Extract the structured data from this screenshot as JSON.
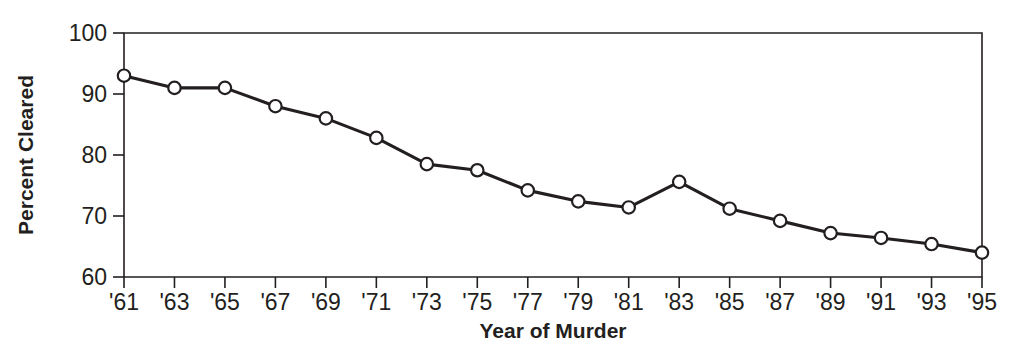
{
  "chart_data": {
    "type": "line",
    "title": "",
    "xlabel": "Year of Murder",
    "ylabel": "Percent Cleared",
    "categories": [
      "'61",
      "'63",
      "'65",
      "'67",
      "'69",
      "'71",
      "'73",
      "'75",
      "'77",
      "'79",
      "'81",
      "'83",
      "'85",
      "'87",
      "'89",
      "'91",
      "'93",
      "'95"
    ],
    "x": [
      1961,
      1963,
      1965,
      1967,
      1969,
      1971,
      1973,
      1975,
      1977,
      1979,
      1981,
      1983,
      1985,
      1987,
      1989,
      1991,
      1993,
      1995
    ],
    "values": [
      93.0,
      91.0,
      91.0,
      88.0,
      86.0,
      82.8,
      78.5,
      77.5,
      74.2,
      72.4,
      71.4,
      75.6,
      71.2,
      69.2,
      67.2,
      66.4,
      65.4,
      64.0
    ],
    "series": [
      {
        "name": "Percent Cleared",
        "values": [
          93.0,
          91.0,
          91.0,
          88.0,
          86.0,
          82.8,
          78.5,
          77.5,
          74.2,
          72.4,
          71.4,
          75.6,
          71.2,
          69.2,
          67.2,
          66.4,
          65.4,
          64.0
        ]
      }
    ],
    "ylim": [
      60,
      100
    ],
    "yticks": [
      60,
      70,
      80,
      90,
      100
    ],
    "ytick_labels": [
      "60",
      "70",
      "80",
      "90",
      "100"
    ],
    "xtick_labels": [
      "'61",
      "'63",
      "'65",
      "'67",
      "'69",
      "'71",
      "'73",
      "'75",
      "'77",
      "'79",
      "'81",
      "'83",
      "'85",
      "'87",
      "'89",
      "'91",
      "'93",
      "'95"
    ],
    "grid": false,
    "legend": false,
    "legend_position": "none",
    "marker": "open-circle",
    "line_color": "#231f20",
    "marker_fill": "#ffffff",
    "background": "#ffffff"
  },
  "labels": {
    "y_axis_title": "Percent Cleared",
    "x_axis_title": "Year of Murder"
  }
}
